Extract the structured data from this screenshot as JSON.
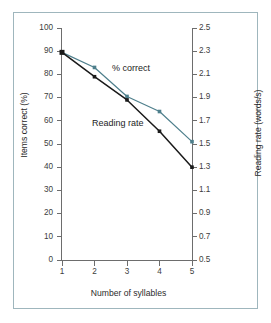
{
  "chart_data": {
    "type": "line",
    "title": "",
    "xlabel": "Number of syllables",
    "ylabel": "Items correct (%)",
    "y2label": "Reading rate (words/s)",
    "x": [
      1,
      2,
      3,
      4,
      5
    ],
    "xlim": [
      1,
      5
    ],
    "ylim": [
      0,
      100
    ],
    "y2lim": [
      0.5,
      2.5
    ],
    "grid": false,
    "legend_position": "inline-annotations",
    "xticks": [
      "1",
      "2",
      "3",
      "4",
      "5"
    ],
    "yticks": [
      "0",
      "10",
      "20",
      "30",
      "40",
      "50",
      "60",
      "70",
      "80",
      "90",
      "100"
    ],
    "y2ticks": [
      "0.5",
      "0.7",
      "0.9",
      "1.1",
      "1.3",
      "1.5",
      "1.7",
      "1.9",
      "2.1",
      "2.3",
      "2.5"
    ],
    "series": [
      {
        "name": "% correct",
        "axis": "left",
        "color": "#4e7f8c",
        "marker": "square",
        "values": [
          89.5,
          83.0,
          70.5,
          64.0,
          51.0
        ]
      },
      {
        "name": "Reading rate",
        "axis": "right",
        "color": "#1a1a1a",
        "marker": "square",
        "values": [
          2.29,
          2.08,
          1.88,
          1.61,
          1.3
        ]
      }
    ],
    "annotations": [
      {
        "text": "% correct",
        "x": 2.6,
        "y": 79
      },
      {
        "text": "Reading rate",
        "x": 2.0,
        "y": 58
      }
    ]
  },
  "colors": {
    "frame": "#9fb6bd",
    "axis": "#6d6d6d",
    "series_pct_correct": "#4e7f8c",
    "series_reading_rate": "#1a1a1a",
    "background": "#ffffff"
  }
}
